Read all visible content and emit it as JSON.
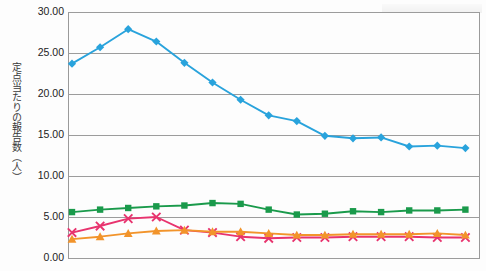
{
  "chart_data": {
    "type": "line",
    "title": "",
    "xlabel": "",
    "ylabel": "定点当たりの報告数（人）",
    "ylim": [
      0,
      30
    ],
    "ytick_labels": [
      "30.00",
      "25.00",
      "20.00",
      "15.00",
      "10.00",
      "5.00",
      "0.00"
    ],
    "ytick_values": [
      30,
      25,
      20,
      15,
      10,
      5,
      0
    ],
    "grid": true,
    "legend": "none",
    "x": [
      1,
      2,
      3,
      4,
      5,
      6,
      7,
      8,
      9,
      10,
      11,
      12,
      13,
      14,
      15
    ],
    "series": [
      {
        "name": "series-blue",
        "color": "#29A3DC",
        "marker": "diamond",
        "values": [
          23.7,
          25.7,
          27.9,
          26.4,
          23.8,
          21.4,
          19.3,
          17.4,
          16.7,
          14.9,
          14.6,
          14.7,
          13.6,
          13.7,
          13.4
        ]
      },
      {
        "name": "series-green",
        "color": "#1A9A4B",
        "marker": "square",
        "values": [
          5.6,
          5.9,
          6.1,
          6.3,
          6.4,
          6.7,
          6.6,
          5.9,
          5.3,
          5.4,
          5.7,
          5.6,
          5.8,
          5.8,
          5.9
        ]
      },
      {
        "name": "series-pink",
        "color": "#E8336E",
        "marker": "x",
        "values": [
          3.1,
          3.9,
          4.8,
          5.0,
          3.4,
          3.1,
          2.6,
          2.4,
          2.5,
          2.5,
          2.6,
          2.6,
          2.6,
          2.5,
          2.5
        ]
      },
      {
        "name": "series-orange",
        "color": "#F2942B",
        "marker": "triangle",
        "values": [
          2.3,
          2.6,
          3.0,
          3.3,
          3.4,
          3.2,
          3.2,
          3.0,
          2.8,
          2.8,
          2.9,
          2.9,
          2.9,
          3.0,
          2.8
        ]
      }
    ]
  }
}
